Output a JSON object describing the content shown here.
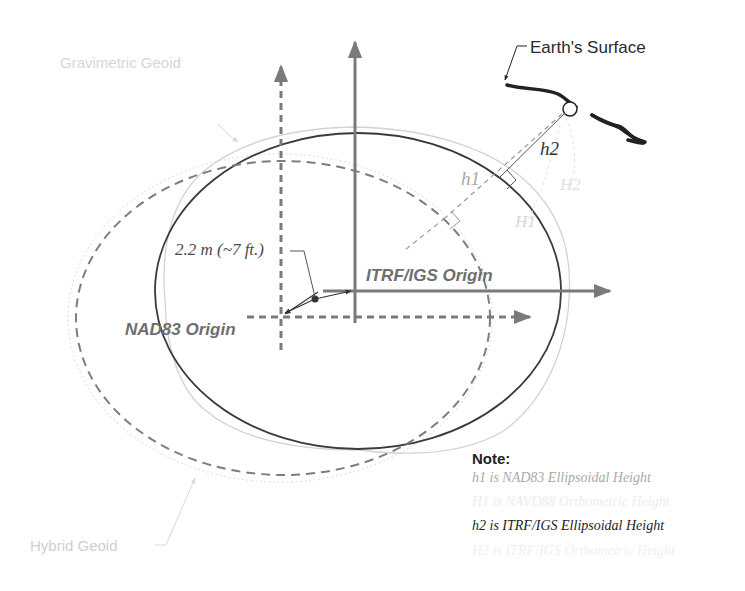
{
  "diagram": {
    "labels": {
      "earth_surface": "Earth's Surface",
      "gravimetric_geoid": "Gravimetric Geoid",
      "hybrid_geoid": "Hybrid Geoid",
      "offset": "2.2 m (~7 ft.)",
      "itrf_origin": "ITRF/IGS Origin",
      "nad83_origin": "NAD83 Origin",
      "h2": "h2",
      "h1": "h1",
      "H1": "H1",
      "H2": "H2"
    },
    "note": {
      "title": "Note:",
      "lines": [
        "h1 is NAD83 Ellipsoidal Height",
        "H1 is NAVD88 Orthometric Height",
        "h2 is ITRF/IGS Ellipsoidal Height",
        "H2 is ITRF/IGS Orthometric Height"
      ]
    },
    "colors": {
      "itrf_ellipse": "#3a3a3a",
      "nad83_ellipse": "#7a7a7a",
      "axes": "#7a7a7a",
      "geoid": "#d0d0d0",
      "earth_surface": "#222222"
    }
  }
}
